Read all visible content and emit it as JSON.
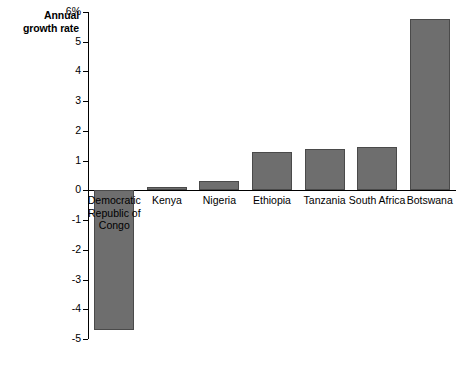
{
  "chart_data": {
    "type": "bar",
    "title": "Annual growth rate",
    "title_lines": [
      "Annual",
      "growth rate"
    ],
    "xlabel": "",
    "ylabel": "Annual growth rate",
    "categories": [
      "Democratic Republic of Congo",
      "Kenya",
      "Nigeria",
      "Ethiopia",
      "Tanzania",
      "South Africa",
      "Botswana"
    ],
    "category_label_lines": [
      [
        "Democratic",
        "Republic of",
        "Congo"
      ],
      [
        "Kenya"
      ],
      [
        "Nigeria"
      ],
      [
        "Ethiopia"
      ],
      [
        "Tanzania"
      ],
      [
        "South Africa"
      ],
      [
        "Botswana"
      ]
    ],
    "values": [
      -4.7,
      0.1,
      0.3,
      1.3,
      1.4,
      1.45,
      5.75
    ],
    "ylim": [
      -5,
      6
    ],
    "ytick_values": [
      6,
      5,
      4,
      3,
      2,
      1,
      0,
      -1,
      -2,
      -3,
      -4,
      -5
    ],
    "ytick_labels": [
      "6%",
      "5",
      "4",
      "3",
      "2",
      "1",
      "0",
      "-1",
      "-2",
      "-3",
      "-4",
      "-5"
    ],
    "grid": false,
    "legend": null,
    "bar_color": "#6e6e6e",
    "bar_edge_color": "#4a4a4a",
    "axis_color": "#000000",
    "background_color": "#ffffff"
  }
}
